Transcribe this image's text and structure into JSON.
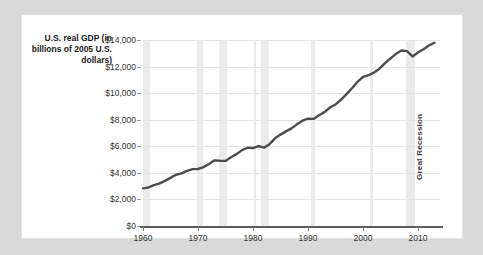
{
  "chart_data": {
    "type": "line",
    "title": "",
    "ylabel": "U.S. real GDP (in billions of 2005 U.S. dollars)",
    "xlabel": "",
    "xlim": [
      1960,
      2014
    ],
    "ylim": [
      0,
      14000
    ],
    "ytick_labels": [
      "$0",
      "$2,000",
      "$4,000",
      "$6,000",
      "$8,000",
      "$10,000",
      "$12,000",
      "$14,000"
    ],
    "ytick_values": [
      0,
      2000,
      4000,
      6000,
      8000,
      10000,
      12000,
      14000
    ],
    "xtick_labels": [
      "1960",
      "1970",
      "1980",
      "1990",
      "2000",
      "2010"
    ],
    "xtick_values": [
      1960,
      1970,
      1980,
      1990,
      2000,
      2010
    ],
    "grid": true,
    "legend": "none",
    "line_color": "#4d4d4d",
    "band_color": "#ebebeb",
    "series": [
      {
        "name": "U.S. real GDP",
        "x": [
          1960,
          1961,
          1962,
          1963,
          1964,
          1965,
          1966,
          1967,
          1968,
          1969,
          1970,
          1971,
          1972,
          1973,
          1974,
          1975,
          1976,
          1977,
          1978,
          1979,
          1980,
          1981,
          1982,
          1983,
          1984,
          1985,
          1986,
          1987,
          1988,
          1989,
          1990,
          1991,
          1992,
          1993,
          1994,
          1995,
          1996,
          1997,
          1998,
          1999,
          2000,
          2001,
          2002,
          2003,
          2004,
          2005,
          2006,
          2007,
          2008,
          2009,
          2010,
          2011,
          2012,
          2013
        ],
        "values": [
          2830,
          2900,
          3080,
          3210,
          3400,
          3620,
          3860,
          3960,
          4150,
          4280,
          4290,
          4430,
          4670,
          4940,
          4910,
          4900,
          5170,
          5410,
          5710,
          5890,
          5870,
          6020,
          5900,
          6160,
          6600,
          6880,
          7120,
          7350,
          7650,
          7930,
          8080,
          8060,
          8340,
          8570,
          8920,
          9150,
          9500,
          9930,
          10370,
          10850,
          11230,
          11350,
          11550,
          11840,
          12260,
          12620,
          12960,
          13210,
          13160,
          12760,
          13060,
          13300,
          13590,
          13790
        ]
      }
    ],
    "annotations": [
      {
        "label": "Great Recession",
        "x_start": 2007.9,
        "x_end": 2009.4,
        "orientation": "vertical"
      }
    ],
    "recession_bands": [
      {
        "x_start": 1960.0,
        "x_end": 1961.2
      },
      {
        "x_start": 1969.9,
        "x_end": 1970.9
      },
      {
        "x_start": 1973.9,
        "x_end": 1975.2
      },
      {
        "x_start": 1980.1,
        "x_end": 1980.6
      },
      {
        "x_start": 1981.5,
        "x_end": 1982.9
      },
      {
        "x_start": 1990.5,
        "x_end": 1991.2
      },
      {
        "x_start": 2001.2,
        "x_end": 2001.9
      },
      {
        "x_start": 2007.9,
        "x_end": 2009.4
      }
    ]
  }
}
